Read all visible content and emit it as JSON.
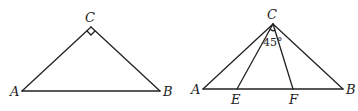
{
  "figures": [
    {
      "id": "left",
      "description": "Isosceles right triangle with right angle at C",
      "labels": {
        "A": "A",
        "B": "B",
        "C": "C"
      },
      "right_angle_at": "C"
    },
    {
      "id": "right",
      "description": "Triangle ABC with points E and F on AB, angle ECF marked",
      "labels": {
        "A": "A",
        "B": "B",
        "C": "C",
        "E": "E",
        "F": "F"
      },
      "angle_label": "45°"
    }
  ]
}
